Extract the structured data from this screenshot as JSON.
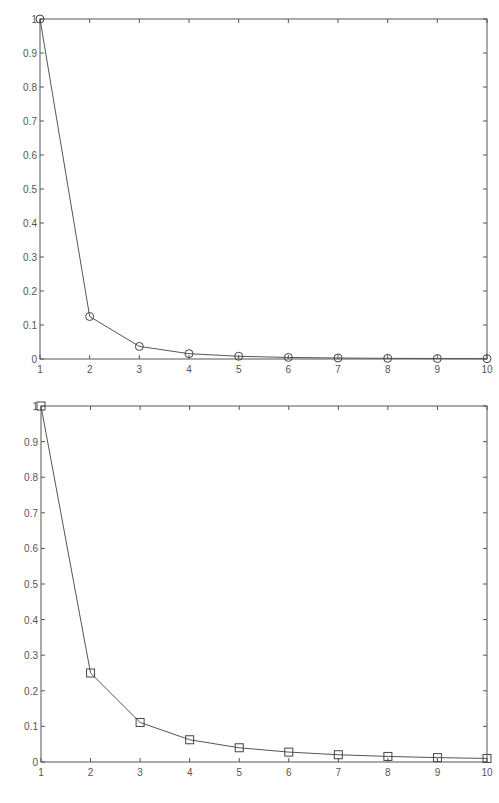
{
  "chart_data": [
    {
      "type": "line",
      "title": "",
      "xlabel": "",
      "ylabel": "",
      "x": [
        1,
        2,
        3,
        4,
        5,
        6,
        7,
        8,
        9,
        10
      ],
      "series": [
        {
          "name": "",
          "marker": "circle",
          "values": [
            1.0,
            0.125,
            0.037,
            0.0156,
            0.008,
            0.0046,
            0.0029,
            0.002,
            0.0014,
            0.001
          ]
        }
      ],
      "xlim": [
        1,
        10
      ],
      "ylim": [
        0,
        1
      ],
      "xticks": [
        "1",
        "2",
        "3",
        "4",
        "5",
        "6",
        "7",
        "8",
        "9",
        "10"
      ],
      "yticks": [
        "0",
        "0.1",
        "0.2",
        "0.3",
        "0.4",
        "0.5",
        "0.6",
        "0.7",
        "0.8",
        "0.9",
        "1"
      ],
      "grid": false,
      "legend": null,
      "box": {
        "left": 40,
        "top": 19,
        "right": 487,
        "bottom": 359
      }
    },
    {
      "type": "line",
      "title": "",
      "xlabel": "",
      "ylabel": "",
      "x": [
        1,
        2,
        3,
        4,
        5,
        6,
        7,
        8,
        9,
        10
      ],
      "series": [
        {
          "name": "",
          "marker": "square",
          "values": [
            1.0,
            0.25,
            0.111,
            0.0625,
            0.04,
            0.0278,
            0.0204,
            0.0156,
            0.0123,
            0.01
          ]
        }
      ],
      "xlim": [
        1,
        10
      ],
      "ylim": [
        0,
        1
      ],
      "xticks": [
        "1",
        "2",
        "3",
        "4",
        "5",
        "6",
        "7",
        "8",
        "9",
        "10"
      ],
      "yticks": [
        "0",
        "0.1",
        "0.2",
        "0.3",
        "0.4",
        "0.5",
        "0.6",
        "0.7",
        "0.8",
        "0.9",
        "1"
      ],
      "grid": false,
      "legend": null,
      "box": {
        "left": 41,
        "top": 406,
        "right": 487,
        "bottom": 762
      }
    }
  ],
  "style": {
    "axis_color": "#555555",
    "line_color": "#555555",
    "marker_color": "#444444",
    "background": "#ffffff"
  }
}
